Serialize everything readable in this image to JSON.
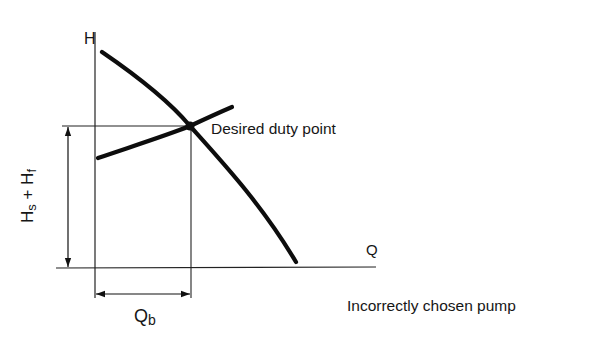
{
  "diagram": {
    "type": "pump-system-curve",
    "axes": {
      "y_label": "H",
      "x_label": "Q"
    },
    "annotations": {
      "duty_point": "Desired duty point",
      "head_dimension": {
        "main1": "H",
        "sub1": "s",
        "plus": " + ",
        "main2": "H",
        "sub2": "f"
      },
      "flow_dimension": {
        "main": "Q",
        "sub": "b"
      }
    },
    "caption": "Incorrectly chosen pump",
    "curves": [
      {
        "name": "pump-curve",
        "description": "falling H-Q pump characteristic"
      },
      {
        "name": "system-curve",
        "description": "rising system resistance curve"
      }
    ],
    "colors": {
      "ink": "#111111",
      "background": "#ffffff"
    }
  }
}
